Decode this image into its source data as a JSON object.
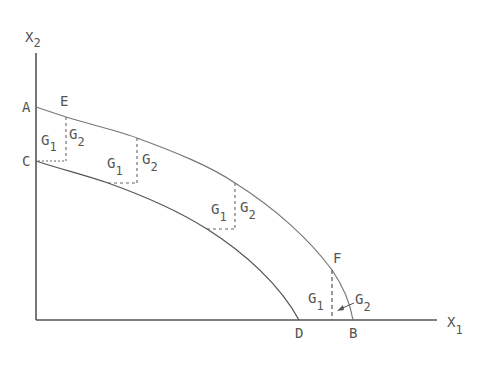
{
  "diagram": {
    "type": "production-possibility-frontiers",
    "axes": {
      "x_label": "X",
      "x_sub": "1",
      "y_label": "X",
      "y_sub": "2"
    },
    "points": {
      "A": "A",
      "C": "C",
      "E": "E",
      "F": "F",
      "D": "D",
      "B": "B"
    },
    "curves": [
      {
        "name": "outer-frontier",
        "from": "A",
        "to": "B",
        "through": [
          "E",
          "F"
        ]
      },
      {
        "name": "inner-frontier",
        "from": "C",
        "to": "D"
      }
    ],
    "gap_labels": [
      {
        "g1": "G",
        "g1_sub": "1",
        "g2": "G",
        "g2_sub": "2"
      },
      {
        "g1": "G",
        "g1_sub": "1",
        "g2": "G",
        "g2_sub": "2"
      },
      {
        "g1": "G",
        "g1_sub": "1",
        "g2": "G",
        "g2_sub": "2"
      },
      {
        "g1": "G",
        "g1_sub": "1",
        "g2": "G",
        "g2_sub": "2"
      }
    ],
    "colors": {
      "axis": "#555555",
      "curve": "#666666",
      "dashed": "#666666",
      "background": "#ffffff"
    }
  }
}
